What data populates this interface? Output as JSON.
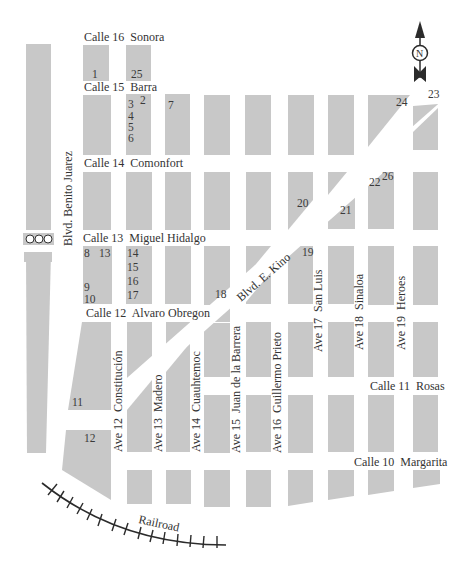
{
  "map": {
    "title": "Street map",
    "colors": {
      "block": "#c8c8c8",
      "text": "#333333",
      "background": "#ffffff",
      "rail": "#2b2b2b"
    },
    "compass": {
      "label": "N",
      "icon": "north-arrow-icon"
    },
    "streets_horizontal": [
      {
        "id": "calle16",
        "label": "Calle 16  Sonora"
      },
      {
        "id": "calle15",
        "label": "Calle 15  Barra"
      },
      {
        "id": "calle14",
        "label": "Calle 14  Comonfort"
      },
      {
        "id": "calle13",
        "label": "Calle 13  Miguel Hidalgo"
      },
      {
        "id": "calle12",
        "label": "Calle 12  Alvaro Obregon"
      },
      {
        "id": "calle11",
        "label": "Calle 11  Rosas"
      },
      {
        "id": "calle10",
        "label": "Calle 10  Margarita"
      }
    ],
    "streets_vertical": [
      {
        "id": "benito",
        "label": "Blvd. Benito Juarez"
      },
      {
        "id": "ave12",
        "label": "Ave 12  Constitución"
      },
      {
        "id": "ave13",
        "label": "Ave 13  Madero"
      },
      {
        "id": "ave14",
        "label": "Ave 14  Cuauhtemoc"
      },
      {
        "id": "ave15",
        "label": "Ave 15  Juan de la Barrera"
      },
      {
        "id": "ave16",
        "label": "Ave 16  Guillermo Prieto"
      },
      {
        "id": "ave17",
        "label": "Ave 17  San Luis"
      },
      {
        "id": "ave18",
        "label": "Ave 18  Sinaloa"
      },
      {
        "id": "ave19",
        "label": "Ave 19  Heroes"
      }
    ],
    "diagonal": {
      "label": "Blvd. E. Kino"
    },
    "railroad": {
      "label": "Railroad"
    },
    "markers": [
      "1",
      "2",
      "3",
      "4",
      "5",
      "6",
      "7",
      "8",
      "9",
      "10",
      "11",
      "12",
      "13",
      "14",
      "15",
      "16",
      "17",
      "18",
      "19",
      "20",
      "21",
      "22",
      "23",
      "24",
      "25",
      "26"
    ]
  }
}
